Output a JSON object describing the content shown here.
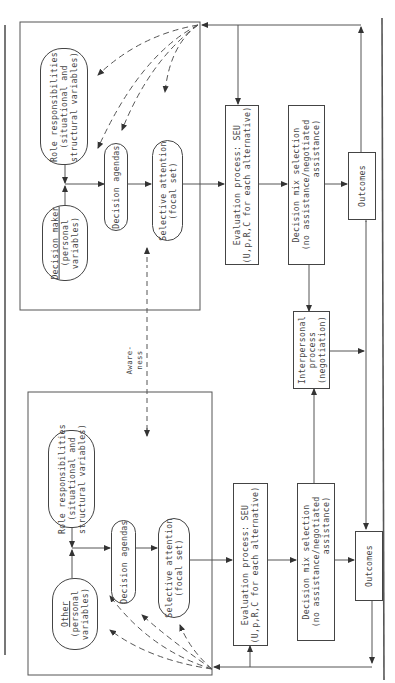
{
  "diagram": {
    "orientation": "rotated 90° counter-clockwise",
    "upper_party": {
      "role": {
        "line1": "Role responsibilities",
        "line2": "(situational and",
        "line3": "structural variables)"
      },
      "actor": {
        "name": "Decision maker",
        "line2": "(personal",
        "line3": "variables)"
      },
      "agendas": "Decision agendas",
      "attention": {
        "line1": "Selective attention",
        "line2": "(focal set)"
      },
      "evaluation": {
        "line1": "Evaluation process: SEU",
        "line2": "(U,p,R,C for each alternative)"
      },
      "mix": {
        "line1": "Decision mix selection",
        "line2": "(no assistance/negotiated",
        "line3": "assistance)"
      },
      "outcomes": "Outcomes"
    },
    "lower_party": {
      "role": {
        "line1": "Role responsibilities",
        "line2": "(situational and",
        "line3": "structural variables)"
      },
      "actor": {
        "name": "Other",
        "line2": "(personal",
        "line3": "variables)"
      },
      "agendas": "Decision agendas",
      "attention": {
        "line1": "Selective attention",
        "line2": "(focal set)"
      },
      "evaluation": {
        "line1": "Evaluation process: SEU",
        "line2": "(U,p,R,C for each alternative)"
      },
      "mix": {
        "line1": "Decision mix selection",
        "line2": "(no assistance/negotiated",
        "line3": "assistance)"
      },
      "outcomes": "Outcomes"
    },
    "interpersonal": {
      "line1": "Interpersonal",
      "line2": "process",
      "line3": "(negotiation)"
    },
    "awareness": {
      "line1": "Aware-",
      "line2": "ness"
    },
    "colors": {
      "line": "#444444",
      "background": "#ffffff"
    }
  }
}
